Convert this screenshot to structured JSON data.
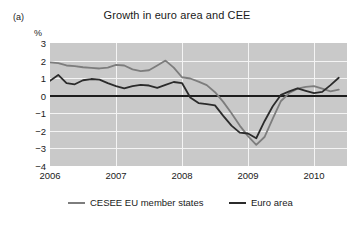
{
  "panel": {
    "label": "(a)"
  },
  "legend": {
    "position": "below-axes",
    "entries": [
      {
        "name": "CESEE EU member states",
        "color": "#7d7d7d"
      },
      {
        "name": "Euro area",
        "color": "#2b2b2b"
      }
    ]
  },
  "chart_data": {
    "type": "line",
    "title": "Growth in euro area and CEE",
    "xlabel": "",
    "ylabel": "%",
    "ylim": [
      -4,
      3
    ],
    "xlim": [
      2006.0,
      2010.5
    ],
    "yticks": [
      "3",
      "2",
      "1",
      "0",
      "−1",
      "−2",
      "−3",
      "−4"
    ],
    "ytick_values": [
      3,
      2,
      1,
      0,
      -1,
      -2,
      -3,
      -4
    ],
    "xticks": [
      "2006",
      "2007",
      "2008",
      "2009",
      "2010"
    ],
    "xtick_values": [
      2006,
      2007,
      2008,
      2009,
      2010
    ],
    "grid": "horizontal-and-vertical-white-on-gray",
    "zero_line": true,
    "x": [
      2006.0,
      2006.125,
      2006.25,
      2006.375,
      2006.5,
      2006.625,
      2006.75,
      2006.875,
      2007.0,
      2007.125,
      2007.25,
      2007.375,
      2007.5,
      2007.625,
      2007.75,
      2007.875,
      2008.0,
      2008.125,
      2008.25,
      2008.375,
      2008.5,
      2008.625,
      2008.75,
      2008.875,
      2009.0,
      2009.125,
      2009.25,
      2009.375,
      2009.5,
      2009.625,
      2009.75,
      2009.875,
      2010.0,
      2010.125,
      2010.25,
      2010.375
    ],
    "series": [
      {
        "name": "CESEE EU member states",
        "color": "#7d7d7d",
        "values": [
          1.9,
          1.85,
          1.72,
          1.68,
          1.62,
          1.58,
          1.55,
          1.6,
          1.75,
          1.72,
          1.5,
          1.4,
          1.45,
          1.72,
          2.0,
          1.6,
          1.05,
          0.98,
          0.8,
          0.6,
          0.2,
          -0.35,
          -1.0,
          -1.7,
          -2.3,
          -2.8,
          -2.35,
          -1.3,
          -0.3,
          0.15,
          0.4,
          0.5,
          0.55,
          0.4,
          0.25,
          0.35
        ]
      },
      {
        "name": "Euro area",
        "color": "#2b2b2b",
        "values": [
          0.85,
          1.18,
          0.72,
          0.65,
          0.88,
          0.95,
          0.92,
          0.72,
          0.55,
          0.42,
          0.55,
          0.62,
          0.58,
          0.45,
          0.62,
          0.78,
          0.72,
          -0.1,
          -0.42,
          -0.48,
          -0.55,
          -1.15,
          -1.7,
          -2.1,
          -2.15,
          -2.42,
          -1.45,
          -0.6,
          0.05,
          0.25,
          0.42,
          0.28,
          0.15,
          0.22,
          0.6,
          1.02
        ]
      }
    ]
  }
}
